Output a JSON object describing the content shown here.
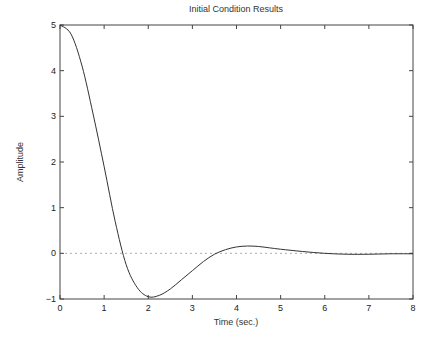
{
  "chart_data": {
    "type": "line",
    "title": "Initial Condition Results",
    "xlabel": "Time (sec.)",
    "ylabel": "Amplitude",
    "xlim": [
      0,
      8
    ],
    "ylim": [
      -1,
      5
    ],
    "xticks": [
      0,
      1,
      2,
      3,
      4,
      5,
      6,
      7,
      8
    ],
    "yticks": [
      -1,
      0,
      1,
      2,
      3,
      4,
      5
    ],
    "grid": false,
    "reference_line": {
      "y": 0,
      "style": "dotted"
    },
    "series": [
      {
        "name": "response",
        "x": [
          0,
          0.25,
          0.5,
          0.75,
          1.0,
          1.25,
          1.5,
          1.75,
          2.0,
          2.25,
          2.5,
          2.75,
          3.0,
          3.25,
          3.5,
          3.75,
          4.0,
          4.25,
          4.5,
          4.75,
          5.0,
          5.5,
          6.0,
          6.5,
          7.0,
          7.5,
          8.0
        ],
        "y": [
          5.0,
          4.8,
          4.1,
          3.05,
          1.9,
          0.7,
          -0.25,
          -0.75,
          -0.95,
          -0.92,
          -0.78,
          -0.58,
          -0.38,
          -0.18,
          -0.02,
          0.08,
          0.14,
          0.16,
          0.15,
          0.12,
          0.09,
          0.04,
          0.0,
          -0.02,
          -0.02,
          -0.01,
          -0.01
        ]
      }
    ]
  },
  "colors": {
    "line": "#333333",
    "axis": "#444444",
    "zero_line": "#999999"
  }
}
